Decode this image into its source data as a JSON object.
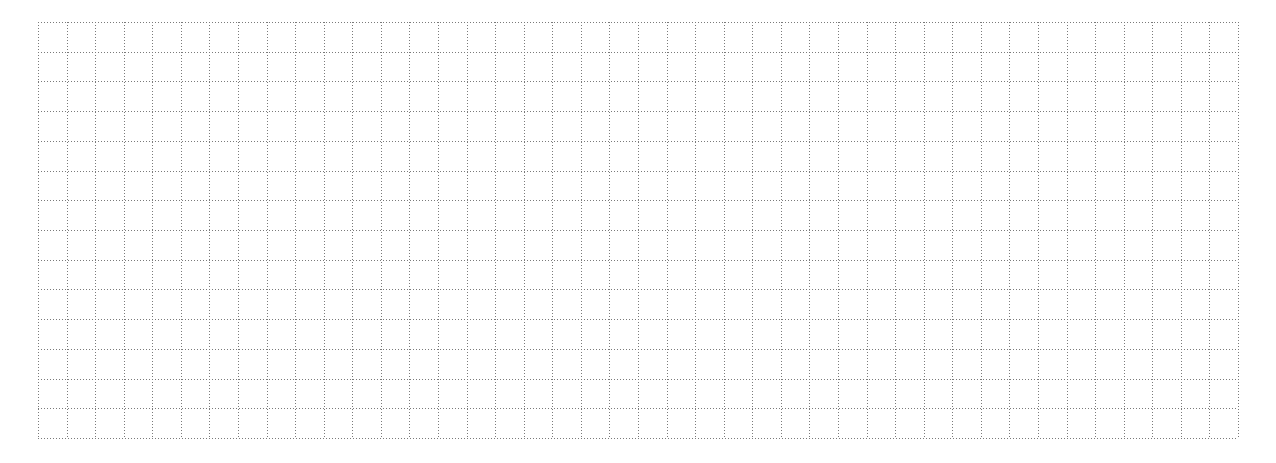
{
  "grid": {
    "left": 38,
    "top": 22,
    "width": 1200,
    "height": 416,
    "columns": 42,
    "rows": 14,
    "line_color": "#7a7a7a",
    "line_style": "dotted",
    "background": "#ffffff"
  }
}
